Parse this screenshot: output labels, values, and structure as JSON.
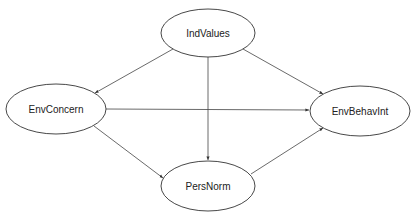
{
  "diagram": {
    "type": "path-diagram",
    "nodes": [
      {
        "id": "IndValues",
        "label": "IndValues",
        "cx": 208,
        "cy": 33,
        "rx": 47,
        "ry": 24
      },
      {
        "id": "EnvConcern",
        "label": "EnvConcern",
        "cx": 56,
        "cy": 109,
        "rx": 50,
        "ry": 25
      },
      {
        "id": "EnvBehavInt",
        "label": "EnvBehavInt",
        "cx": 360,
        "cy": 111,
        "rx": 50,
        "ry": 25
      },
      {
        "id": "PersNorm",
        "label": "PersNorm",
        "cx": 208,
        "cy": 186,
        "rx": 47,
        "ry": 25
      }
    ],
    "edges": [
      {
        "from": "IndValues",
        "to": "EnvConcern"
      },
      {
        "from": "IndValues",
        "to": "PersNorm"
      },
      {
        "from": "IndValues",
        "to": "EnvBehavInt"
      },
      {
        "from": "EnvConcern",
        "to": "EnvBehavInt"
      },
      {
        "from": "EnvConcern",
        "to": "PersNorm"
      },
      {
        "from": "PersNorm",
        "to": "EnvBehavInt"
      }
    ],
    "colors": {
      "stroke": "#333333",
      "text": "#222222",
      "background": "#ffffff"
    }
  }
}
